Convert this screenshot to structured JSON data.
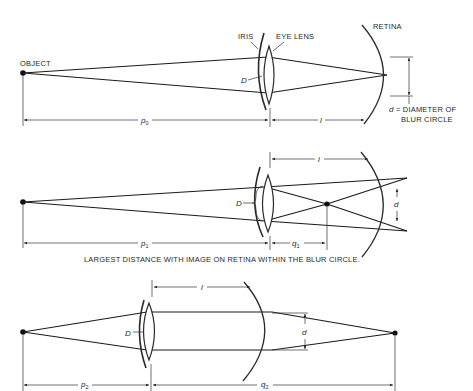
{
  "diagram1": {
    "labels": {
      "object": "OBJECT",
      "iris": "IRIS",
      "eye_lens": "EYE LENS",
      "retina": "RETINA",
      "aperture": "D",
      "distance_object": "p",
      "distance_object_sub": "0",
      "lens_retina": "l",
      "blur_d": "d",
      "blur_def_line1": " = DIAMETER OF",
      "blur_def_line2": "BLUR CIRCLE"
    }
  },
  "diagram2": {
    "labels": {
      "aperture": "D",
      "lens_retina": "l",
      "distance_object": "p",
      "distance_object_sub": "1",
      "distance_image": "q",
      "distance_image_sub": "1",
      "blur_d": "d"
    },
    "caption": "LARGEST DISTANCE WITH IMAGE ON RETINA WITHIN THE BLUR CIRCLE."
  },
  "diagram3": {
    "labels": {
      "aperture": "D",
      "lens_retina": "l",
      "distance_object": "p",
      "distance_object_sub": "2",
      "distance_image": "q",
      "distance_image_sub": "2",
      "blur_d": "d"
    }
  },
  "colors": {
    "ink": "#1a1a1a",
    "background": "#ffffff"
  }
}
